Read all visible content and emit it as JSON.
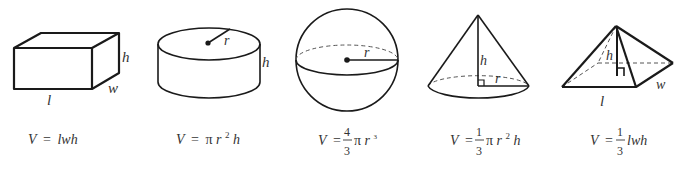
{
  "shapes": [
    {
      "name": "rectangular-prism",
      "labels": {
        "height": "h",
        "width": "w",
        "length": "l"
      },
      "formula": {
        "lhs": "V",
        "eq": "=",
        "rhs": "lwh"
      }
    },
    {
      "name": "cylinder",
      "labels": {
        "radius": "r",
        "height": "h"
      },
      "formula": {
        "lhs": "V",
        "eq": "=",
        "pi": "π",
        "r": "r",
        "exp": "2",
        "h": "h"
      }
    },
    {
      "name": "sphere",
      "labels": {
        "radius": "r"
      },
      "formula": {
        "lhs": "V",
        "eq": "=",
        "num": "4",
        "den": "3",
        "pi": "π",
        "r": "r",
        "exp": "3"
      }
    },
    {
      "name": "cone",
      "labels": {
        "height": "h",
        "radius": "r"
      },
      "formula": {
        "lhs": "V",
        "eq": "=",
        "num": "1",
        "den": "3",
        "pi": "π",
        "r": "r",
        "exp": "2",
        "h": "h"
      }
    },
    {
      "name": "pyramid",
      "labels": {
        "height": "h",
        "length": "l",
        "width": "w"
      },
      "formula": {
        "lhs": "V",
        "eq": "=",
        "num": "1",
        "den": "3",
        "rest": "lwh"
      }
    }
  ],
  "colors": {
    "line": "#1a1a1a",
    "text": "#333333",
    "background": "#ffffff"
  }
}
